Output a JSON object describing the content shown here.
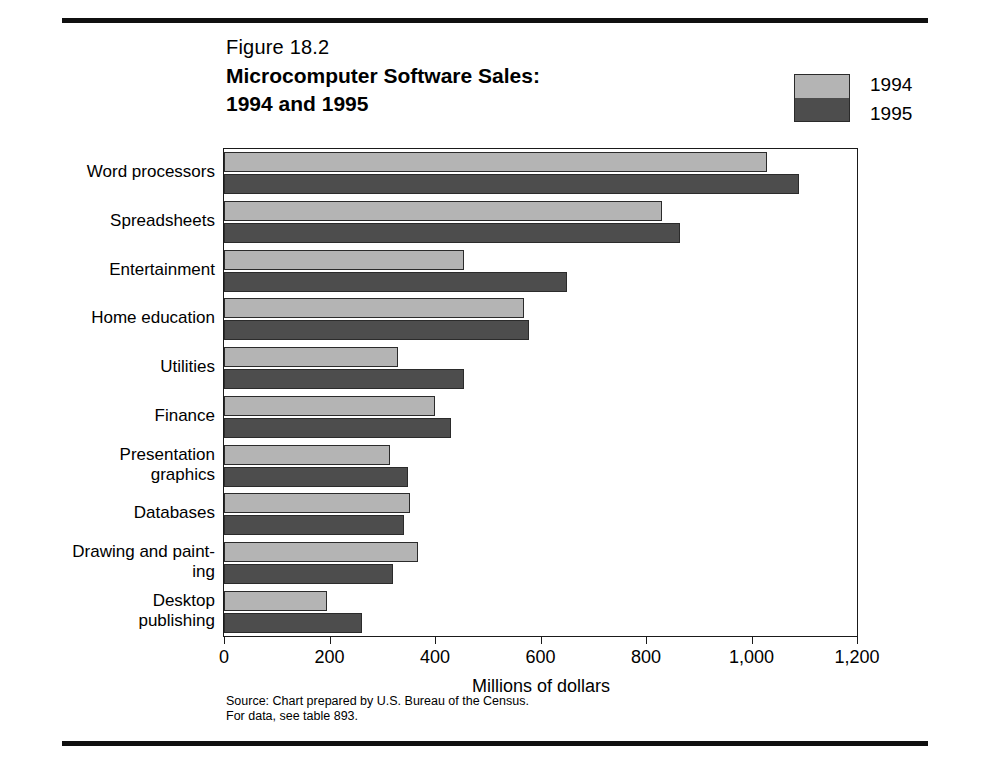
{
  "figure": {
    "number": "Figure 18.2",
    "title_line1": "Microcomputer Software Sales:",
    "title_line2": "1994 and 1995"
  },
  "legend": {
    "position": "top-right",
    "entries": [
      {
        "label": "1994",
        "color": "#b4b4b4"
      },
      {
        "label": "1995",
        "color": "#4d4d4d"
      }
    ]
  },
  "source": {
    "line1": "Source: Chart prepared by U.S. Bureau of the Census.",
    "line2": "For data, see table 893."
  },
  "chart_data": {
    "type": "bar",
    "orientation": "horizontal",
    "title": "Microcomputer Software Sales: 1994 and 1995",
    "xlabel": "Millions of dollars",
    "ylabel": "",
    "xlim": [
      0,
      1200
    ],
    "xticks": [
      0,
      200,
      400,
      600,
      800,
      1000,
      1200
    ],
    "xticklabels": [
      "0",
      "200",
      "400",
      "600",
      "800",
      "1,000",
      "1,200"
    ],
    "grid": false,
    "legend_position": "top-right",
    "categories": [
      "Word processors",
      "Spreadsheets",
      "Entertainment",
      "Home education",
      "Utilities",
      "Finance",
      "Presentation graphics",
      "Databases",
      "Drawing and painting",
      "Desktop publishing"
    ],
    "category_label_lines": [
      [
        "Word processors"
      ],
      [
        "Spreadsheets"
      ],
      [
        "Entertainment"
      ],
      [
        "Home education"
      ],
      [
        "Utilities"
      ],
      [
        "Finance"
      ],
      [
        "Presentation",
        "graphics"
      ],
      [
        "Databases"
      ],
      [
        "Drawing and paint-",
        "ing"
      ],
      [
        "Desktop",
        "publishing"
      ]
    ],
    "series": [
      {
        "name": "1994",
        "color": "#b4b4b4",
        "values": [
          1030,
          830,
          455,
          568,
          330,
          400,
          315,
          352,
          368,
          195
        ]
      },
      {
        "name": "1995",
        "color": "#4d4d4d",
        "values": [
          1090,
          865,
          650,
          578,
          455,
          430,
          348,
          342,
          320,
          262
        ]
      }
    ]
  }
}
